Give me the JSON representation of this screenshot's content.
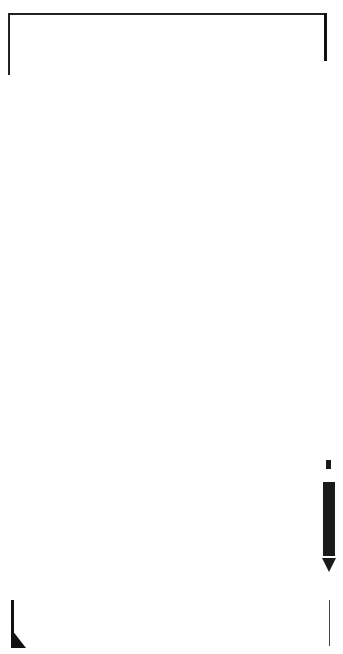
{
  "card": {
    "type": "knitting-machine-punch-card",
    "label": "No.FL-1",
    "marker_letter": "A",
    "colors": {
      "hole": "#111111",
      "paper": "#ffffff",
      "label_bg": "#1a1a1a",
      "label_text": "#ffffff"
    }
  },
  "row_numbers": [
    {
      "y": 32,
      "label": "5"
    },
    {
      "y": 43,
      "label": "49"
    },
    {
      "y": 54,
      "label": "48"
    },
    {
      "y": 65,
      "label": "47"
    },
    {
      "y": 76,
      "label": "46"
    },
    {
      "y": 87,
      "label": "45"
    },
    {
      "y": 98,
      "label": "44"
    },
    {
      "y": 108,
      "label": "43"
    },
    {
      "y": 119,
      "label": "42"
    },
    {
      "y": 130,
      "label": "41"
    },
    {
      "y": 141,
      "label": "40"
    },
    {
      "y": 152,
      "label": "39"
    },
    {
      "y": 163,
      "label": "38"
    },
    {
      "y": 174,
      "label": "37"
    },
    {
      "y": 185,
      "label": "36"
    },
    {
      "y": 196,
      "label": "35"
    },
    {
      "y": 206,
      "label": "34"
    },
    {
      "y": 217,
      "label": "33"
    },
    {
      "y": 228,
      "label": "32"
    },
    {
      "y": 239,
      "label": "31"
    },
    {
      "y": 250,
      "label": "30"
    },
    {
      "y": 261,
      "label": "29"
    },
    {
      "y": 272,
      "label": "28"
    },
    {
      "y": 282,
      "label": "27"
    },
    {
      "y": 293,
      "label": "26"
    },
    {
      "y": 304,
      "label": "25"
    },
    {
      "y": 315,
      "label": "24"
    },
    {
      "y": 326,
      "label": "23"
    },
    {
      "y": 337,
      "label": "22"
    },
    {
      "y": 348,
      "label": "21"
    },
    {
      "y": 359,
      "label": "20"
    },
    {
      "y": 369,
      "label": "19"
    },
    {
      "y": 380,
      "label": "18"
    },
    {
      "y": 391,
      "label": "17"
    },
    {
      "y": 402,
      "label": "16"
    },
    {
      "y": 413,
      "label": "15"
    },
    {
      "y": 424,
      "label": "14"
    },
    {
      "y": 435,
      "label": "13"
    },
    {
      "y": 445,
      "label": "12"
    },
    {
      "y": 456,
      "label": "11"
    },
    {
      "y": 467,
      "label": "10"
    },
    {
      "y": 478,
      "label": "9"
    },
    {
      "y": 489,
      "label": "8"
    },
    {
      "y": 500,
      "label": "7"
    },
    {
      "y": 511,
      "label": "6"
    },
    {
      "y": 521,
      "label": "5"
    },
    {
      "y": 532,
      "label": "4"
    },
    {
      "y": 543,
      "label": "3"
    },
    {
      "y": 554,
      "label": "2"
    },
    {
      "y": 565,
      "label": "1"
    },
    {
      "y": 576,
      "label": "54"
    },
    {
      "y": 587,
      "label": "53"
    },
    {
      "y": 598,
      "label": "52"
    }
  ],
  "pattern_rows": [
    {
      "y": 55,
      "x": [
        90,
        170,
        252
      ]
    },
    {
      "y": 66,
      "x": [
        74,
        154,
        236
      ]
    },
    {
      "y": 76,
      "x": [
        98,
        179,
        260
      ]
    },
    {
      "y": 87,
      "x": [
        66,
        146,
        228
      ]
    },
    {
      "y": 98,
      "x": [
        106,
        187,
        268
      ]
    },
    {
      "y": 109,
      "x": [
        58,
        138,
        220
      ]
    },
    {
      "y": 119,
      "x": [
        114,
        195,
        276
      ]
    },
    {
      "y": 130,
      "x": [
        50,
        130,
        212
      ]
    },
    {
      "y": 152,
      "x": [
        115,
        196,
        277
      ]
    },
    {
      "y": 163,
      "x": [
        50,
        131,
        212
      ]
    },
    {
      "y": 174,
      "x": [
        107,
        188,
        269
      ]
    },
    {
      "y": 184,
      "x": [
        58,
        139,
        220
      ]
    },
    {
      "y": 195,
      "x": [
        99,
        180,
        261
      ]
    },
    {
      "y": 206,
      "x": [
        67,
        147,
        229
      ]
    },
    {
      "y": 217,
      "x": [
        91,
        171,
        253
      ]
    },
    {
      "y": 228,
      "x": [
        75,
        155,
        237
      ]
    },
    {
      "y": 249,
      "x": [
        91,
        172,
        254
      ]
    },
    {
      "y": 261,
      "x": [
        76,
        156,
        238
      ]
    },
    {
      "y": 271,
      "x": [
        100,
        181,
        262
      ]
    },
    {
      "y": 282,
      "x": [
        68,
        148,
        230
      ]
    },
    {
      "y": 293,
      "x": [
        108,
        189,
        270
      ]
    },
    {
      "y": 303,
      "x": [
        60,
        141,
        222
      ]
    },
    {
      "y": 314,
      "x": [
        116,
        197,
        279
      ]
    },
    {
      "y": 325,
      "x": [
        52,
        133,
        214
      ]
    },
    {
      "y": 346,
      "x": [
        117,
        198,
        279
      ]
    },
    {
      "y": 357,
      "x": [
        52,
        133,
        214
      ]
    },
    {
      "y": 367,
      "x": [
        109,
        190,
        271
      ]
    },
    {
      "y": 378,
      "x": [
        60,
        141,
        222
      ]
    },
    {
      "y": 390,
      "x": [
        101,
        182,
        263
      ]
    },
    {
      "y": 401,
      "x": [
        69,
        150,
        231
      ]
    },
    {
      "y": 412,
      "x": [
        94,
        174,
        256
      ]
    },
    {
      "y": 422,
      "x": [
        77,
        158,
        239
      ]
    },
    {
      "y": 444,
      "x": [
        94,
        175,
        256
      ]
    },
    {
      "y": 456,
      "x": [
        78,
        159,
        240
      ]
    },
    {
      "y": 466,
      "x": [
        102,
        183,
        264
      ]
    },
    {
      "y": 477,
      "x": [
        70,
        151,
        232
      ]
    },
    {
      "y": 488,
      "x": [
        110,
        191,
        272
      ]
    },
    {
      "y": 499,
      "x": [
        62,
        143,
        224
      ]
    },
    {
      "y": 510,
      "x": [
        119,
        200,
        281
      ]
    },
    {
      "y": 521,
      "x": [
        54,
        135,
        216
      ]
    },
    {
      "y": 543,
      "x": [
        119,
        200,
        281
      ]
    },
    {
      "y": 554,
      "x": [
        54,
        135,
        216
      ]
    },
    {
      "y": 565,
      "x": [
        112,
        192,
        273
      ]
    },
    {
      "y": 576,
      "x": [
        63,
        144,
        225
      ]
    },
    {
      "y": 586,
      "x": [
        104,
        184,
        266
      ]
    },
    {
      "y": 597,
      "x": [
        72,
        152,
        234
      ]
    },
    {
      "y": 608,
      "x": [
        96,
        177,
        258
      ]
    },
    {
      "y": 619,
      "x": [
        80,
        161,
        242
      ]
    }
  ],
  "full_rows_y": [
    21,
    32,
    630,
    641
  ],
  "overlap_lines_y": [
    581,
    592,
    603,
    614
  ],
  "side_holes": [
    {
      "x": 22,
      "y": 28
    },
    {
      "x": 22,
      "y": 50
    },
    {
      "x": 311,
      "y": 26
    },
    {
      "x": 311,
      "y": 47
    },
    {
      "x": 27,
      "y": 595
    },
    {
      "x": 27,
      "y": 636
    },
    {
      "x": 318,
      "y": 611
    },
    {
      "x": 318,
      "y": 633
    }
  ],
  "rows_top_y": 21,
  "rows_bottom_y": 641,
  "row_spacing": 10.85,
  "arrow_rows_range": [
    21,
    609
  ]
}
